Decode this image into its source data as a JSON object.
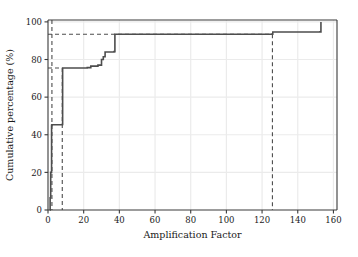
{
  "chart_data": {
    "type": "line",
    "title": "",
    "subtitle": "",
    "xlabel": "Amplification Factor",
    "ylabel": "Cumulative percentage (%)",
    "xlim": [
      0,
      162
    ],
    "ylim": [
      0,
      101
    ],
    "xticks": [
      0,
      20,
      40,
      60,
      80,
      100,
      120,
      140,
      160
    ],
    "xtick_labels": [
      "0",
      "20",
      "40",
      "60",
      "80",
      "100",
      "120",
      "140",
      "160"
    ],
    "yticks": [
      0,
      20,
      40,
      60,
      80,
      100
    ],
    "ytick_labels": [
      "0",
      "20",
      "40",
      "60",
      "80",
      "100"
    ],
    "grid": true,
    "legend": null,
    "legend_position": "none",
    "series": [
      {
        "name": "Cumulative distribution",
        "style": "step-post",
        "color": "#4d4d4d",
        "linewidth": 1.6,
        "x": [
          1.0,
          1.2,
          1.5,
          2.0,
          2.2,
          8.0,
          8.2,
          22.0,
          24.0,
          28.0,
          30.0,
          31.0,
          32.0,
          37.0,
          37.5,
          125.5,
          126.0,
          152.5,
          153.0
        ],
        "y": [
          0.0,
          6.5,
          20.0,
          45.0,
          45.3,
          45.5,
          75.5,
          75.7,
          76.5,
          77.0,
          80.0,
          81.5,
          84.0,
          84.2,
          93.4,
          93.5,
          94.6,
          94.7,
          100.0
        ]
      }
    ],
    "annotations": [
      {
        "name": "lower-percentile-guide",
        "type": "dashed-crosshair",
        "x": 8.0,
        "y": 75.5,
        "color": "#4d4d4d",
        "h_line_from_x": 0,
        "v_line_to_y": 0
      },
      {
        "name": "upper-percentile-guide",
        "type": "dashed-crosshair",
        "x": 125.8,
        "y": 93.4,
        "color": "#4d4d4d",
        "h_line_from_x": 0,
        "v_line_to_y": 0
      },
      {
        "name": "origin-guide",
        "type": "dashed-vertical",
        "x": 2.2,
        "color": "#4d4d4d",
        "v_line_to_y": 0
      }
    ],
    "colors": {
      "line": "#4d4d4d",
      "grid": "#ebebeb",
      "axis": "#3a3a3a",
      "background": "#ffffff",
      "text": "#1a1a1a"
    }
  }
}
